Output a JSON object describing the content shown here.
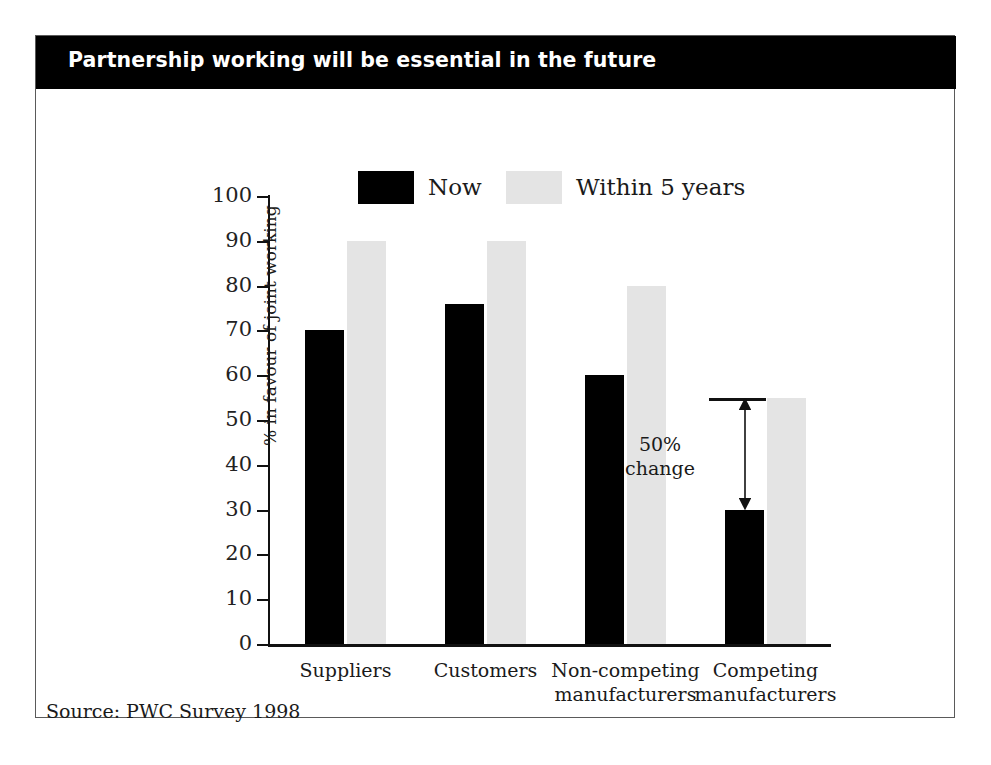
{
  "slide": {
    "title": "Partnership working will be essential in the future",
    "source": "Source: PWC Survey 1998"
  },
  "chart_data": {
    "type": "bar",
    "title": "Partnership working will be essential in the future",
    "categories": [
      "Suppliers",
      "Customers",
      "Non-competing manufacturers",
      "Competing manufacturers"
    ],
    "category_lines": [
      [
        "Suppliers"
      ],
      [
        "Customers"
      ],
      [
        "Non-competing",
        "manufacturers"
      ],
      [
        "Competing",
        "manufacturers"
      ]
    ],
    "series": [
      {
        "name": "Now",
        "color": "#000000",
        "values": [
          70,
          76,
          60,
          30
        ]
      },
      {
        "name": "Within 5 years",
        "color": "#e4e4e4",
        "values": [
          90,
          90,
          80,
          55
        ]
      }
    ],
    "xlabel": "",
    "ylabel": "% in favour of joint working",
    "ylim": [
      0,
      100
    ],
    "yticks": [
      0,
      10,
      20,
      30,
      40,
      50,
      60,
      70,
      80,
      90,
      100
    ],
    "ytick_labels": [
      "0",
      "10",
      "20",
      "30",
      "40",
      "50",
      "60",
      "70",
      "80",
      "90",
      "100"
    ],
    "grid": false,
    "legend_position": "top-center",
    "annotations": [
      {
        "text_lines": [
          "50%",
          "change"
        ],
        "text": "50% change",
        "category": "Competing manufacturers",
        "from_value": 30,
        "to_value": 55,
        "style": "double-headed-arrow-with-cap"
      }
    ],
    "source": "Source: PWC Survey 1998"
  },
  "legend": {
    "items": [
      {
        "label": "Now",
        "swatch": "black"
      },
      {
        "label": "Within 5 years",
        "swatch": "grey"
      }
    ]
  },
  "axis": {
    "y_title": "% in favour of joint working",
    "ticks": [
      "100",
      "90",
      "80",
      "70",
      "60",
      "50",
      "40",
      "30",
      "20",
      "10",
      "0"
    ]
  },
  "colors": {
    "title_band": "#000000",
    "title_text": "#ffffff",
    "series_now": "#000000",
    "series_future": "#e4e4e4",
    "frame": "#5a5a5a",
    "axis": "#111111"
  }
}
